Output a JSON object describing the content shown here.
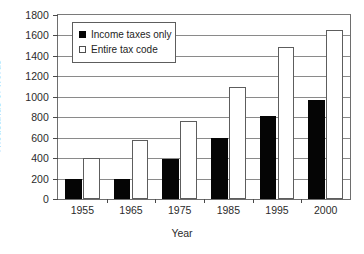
{
  "chart_data": {
    "type": "bar",
    "title": "",
    "subtitle": "",
    "xlabel": "Year",
    "ylabel": "Thousands of words",
    "categories": [
      "1955",
      "1965",
      "1975",
      "1985",
      "1995",
      "2000"
    ],
    "series": [
      {
        "name": "Income taxes only",
        "style": "filled-black",
        "color": "#050505",
        "values": [
          195,
          200,
          395,
          595,
          810,
          970
        ]
      },
      {
        "name": "Entire tax code",
        "style": "open-white",
        "color": "#ffffff",
        "values": [
          403,
          575,
          765,
          1095,
          1490,
          1650
        ]
      }
    ],
    "ylim": [
      0,
      1800
    ],
    "ytick_step": 200,
    "yticks": [
      0,
      200,
      400,
      600,
      800,
      1000,
      1200,
      1400,
      1600,
      1800
    ],
    "ytick_labels": [
      "0",
      "200",
      "400",
      "600",
      "800",
      "1000",
      "1200",
      "1400",
      "1600",
      "1800"
    ],
    "grid": "horizontal",
    "legend_position": "top-left-inside",
    "colors": {
      "series_income": "#050505",
      "series_entire": "#ffffff",
      "grid": "#8a8a8a",
      "axis": "#6e6e6e",
      "text": "#2b2b2b",
      "background": "#ffffff"
    }
  },
  "legend": {
    "items": [
      {
        "label": "Income taxes only"
      },
      {
        "label": "Entire tax code"
      }
    ]
  }
}
